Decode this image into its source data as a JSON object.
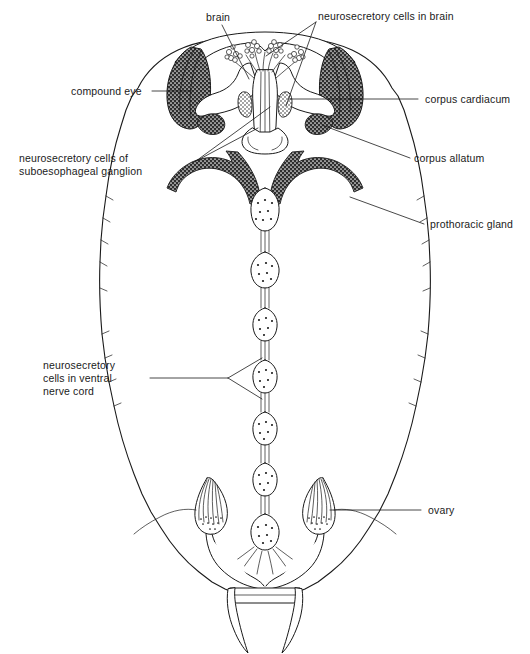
{
  "figure": {
    "title_fragment": "",
    "background_color": "#ffffff",
    "ink_color": "#1a1a1a",
    "stipple_color": "#2b2b2b",
    "width": 530,
    "height": 654
  },
  "labels": {
    "brain": "brain",
    "neurosecretory_cells_in_brain": "neurosecretory cells in brain",
    "compound_eye": "compound eye",
    "corpus_cardiacum": "corpus cardiacum",
    "corpus_allatum": "corpus allatum",
    "neurosecretory_cells_suboesophageal_line1": "neurosecretory cells of",
    "neurosecretory_cells_suboesophageal_line2": "suboesophageal ganglion",
    "prothoracic_gland": "prothoracic gland",
    "ventral_nerve_cord_line1": "neurosecretory",
    "ventral_nerve_cord_line2": "cells in ventral",
    "ventral_nerve_cord_line3": "nerve cord",
    "ovary": "ovary"
  },
  "structures": [
    {
      "name": "body-outline",
      "description": "segmented oval abdomen and thorax outline"
    },
    {
      "name": "head-capsule",
      "description": "broad head capsule at top"
    },
    {
      "name": "compound-eye-left",
      "description": "stippled crescent compound eye"
    },
    {
      "name": "compound-eye-right",
      "description": "stippled crescent compound eye"
    },
    {
      "name": "brain",
      "description": "brain lobes with pars intercerebralis"
    },
    {
      "name": "neurosecretory-cell-cluster",
      "description": "grape-like clusters of neurosecretory cells"
    },
    {
      "name": "corpus-cardiacum-left",
      "description": "neurohaemal organ behind brain"
    },
    {
      "name": "corpus-cardiacum-right",
      "description": "neurohaemal organ behind brain"
    },
    {
      "name": "corpus-allatum-left",
      "description": "small stippled endocrine gland"
    },
    {
      "name": "corpus-allatum-right",
      "description": "small stippled endocrine gland"
    },
    {
      "name": "prothoracic-gland",
      "description": "paired dark stippled X-shaped glands"
    },
    {
      "name": "ventral-nerve-cord",
      "description": "chain of ganglia joined by paired connectives"
    },
    {
      "name": "ovary-left",
      "description": "teardrop ovary with ovarioles and oviduct"
    },
    {
      "name": "ovary-right",
      "description": "teardrop ovary with ovarioles and oviduct"
    },
    {
      "name": "cercus-left",
      "description": "tapering terminal appendage"
    },
    {
      "name": "cercus-right",
      "description": "tapering terminal appendage"
    }
  ]
}
